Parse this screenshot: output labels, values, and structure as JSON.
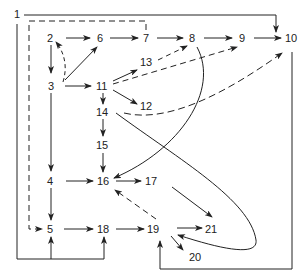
{
  "diagram": {
    "type": "directed-graph",
    "nodes": [
      {
        "id": "1",
        "label": "1",
        "x": 17,
        "y": 14
      },
      {
        "id": "2",
        "label": "2",
        "x": 51,
        "y": 38
      },
      {
        "id": "3",
        "label": "3",
        "x": 53,
        "y": 86
      },
      {
        "id": "4",
        "label": "4",
        "x": 51,
        "y": 181
      },
      {
        "id": "5",
        "label": "5",
        "x": 51,
        "y": 229
      },
      {
        "id": "6",
        "label": "6",
        "x": 101,
        "y": 38
      },
      {
        "id": "7",
        "label": "7",
        "x": 147,
        "y": 38
      },
      {
        "id": "8",
        "label": "8",
        "x": 192,
        "y": 38
      },
      {
        "id": "9",
        "label": "9",
        "x": 242,
        "y": 38
      },
      {
        "id": "10",
        "label": "10",
        "x": 292,
        "y": 38
      },
      {
        "id": "11",
        "label": "11",
        "x": 102,
        "y": 86
      },
      {
        "id": "12",
        "label": "12",
        "x": 147,
        "y": 106
      },
      {
        "id": "13",
        "label": "13",
        "x": 147,
        "y": 62
      },
      {
        "id": "14",
        "label": "14",
        "x": 102,
        "y": 112
      },
      {
        "id": "15",
        "label": "15",
        "x": 102,
        "y": 145
      },
      {
        "id": "16",
        "label": "16",
        "x": 104,
        "y": 181
      },
      {
        "id": "17",
        "label": "17",
        "x": 151,
        "y": 181
      },
      {
        "id": "18",
        "label": "18",
        "x": 104,
        "y": 229
      },
      {
        "id": "19",
        "label": "19",
        "x": 153,
        "y": 229
      },
      {
        "id": "20",
        "label": "20",
        "x": 195,
        "y": 257
      },
      {
        "id": "21",
        "label": "21",
        "x": 211,
        "y": 229
      }
    ],
    "edges_solid": [
      {
        "from": "2",
        "to": "6"
      },
      {
        "from": "6",
        "to": "7"
      },
      {
        "from": "7",
        "to": "8"
      },
      {
        "from": "8",
        "to": "9"
      },
      {
        "from": "9",
        "to": "10"
      },
      {
        "from": "2",
        "to": "3"
      },
      {
        "from": "3",
        "to": "6"
      },
      {
        "from": "3",
        "to": "11"
      },
      {
        "from": "3",
        "to": "4"
      },
      {
        "from": "11",
        "to": "13"
      },
      {
        "from": "11",
        "to": "12"
      },
      {
        "from": "11",
        "to": "14"
      },
      {
        "from": "14",
        "to": "15"
      },
      {
        "from": "15",
        "to": "16"
      },
      {
        "from": "4",
        "to": "16"
      },
      {
        "from": "4",
        "to": "5"
      },
      {
        "from": "16",
        "to": "17"
      },
      {
        "from": "5",
        "to": "18"
      },
      {
        "from": "18",
        "to": "19"
      },
      {
        "from": "19",
        "to": "21"
      },
      {
        "from": "19",
        "to": "20"
      },
      {
        "from": "17",
        "to": "21"
      },
      {
        "from": "8",
        "to": "16"
      },
      {
        "from": "14",
        "to": "19"
      },
      {
        "from": "1",
        "to": "10"
      },
      {
        "from": "1",
        "to": "5"
      },
      {
        "from": "1",
        "to": "18"
      },
      {
        "from": "10",
        "to": "19"
      }
    ],
    "edges_dashed": [
      {
        "from": "3",
        "to": "2"
      },
      {
        "from": "11",
        "to": "8"
      },
      {
        "from": "11",
        "to": "9"
      },
      {
        "from": "14",
        "to": "10"
      },
      {
        "from": "19",
        "to": "16"
      },
      {
        "from": "7",
        "to": "5"
      }
    ],
    "colors": {
      "stroke": "#222222",
      "background": "#ffffff"
    }
  }
}
